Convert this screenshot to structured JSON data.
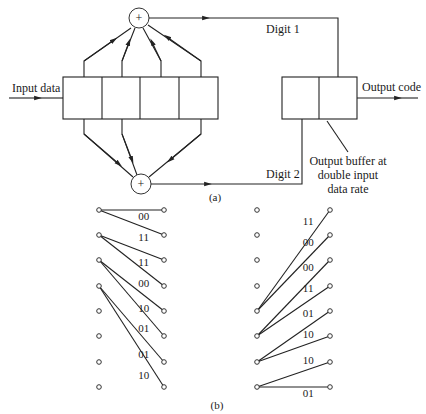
{
  "figure_a": {
    "caption": "(a)",
    "input_label": "Input data",
    "output_label": "Output code",
    "digit1_label": "Digit 1",
    "digit2_label": "Digit 2",
    "buffer_note": [
      "Output buffer at",
      "double input",
      "data rate"
    ],
    "adder_symbol": "+",
    "shift_register_cells": 4,
    "top_adder_taps": [
      1,
      2,
      3,
      4
    ],
    "bottom_adder_taps": [
      1,
      2,
      4
    ],
    "output_buffer_cells": 2
  },
  "figure_b": {
    "caption": "(b)",
    "states": 8,
    "left_trellis": {
      "branches": [
        {
          "from": 0,
          "to": 0,
          "label": "00"
        },
        {
          "from": 0,
          "to": 1,
          "label": "11"
        },
        {
          "from": 1,
          "to": 2,
          "label": "11"
        },
        {
          "from": 1,
          "to": 3,
          "label": "00"
        },
        {
          "from": 2,
          "to": 4,
          "label": "10"
        },
        {
          "from": 2,
          "to": 5,
          "label": "01"
        },
        {
          "from": 3,
          "to": 6,
          "label": "01"
        },
        {
          "from": 3,
          "to": 7,
          "label": "10"
        }
      ]
    },
    "right_trellis": {
      "branches": [
        {
          "from": 4,
          "to": 0,
          "label": "11"
        },
        {
          "from": 4,
          "to": 1,
          "label": "00"
        },
        {
          "from": 5,
          "to": 2,
          "label": "00"
        },
        {
          "from": 5,
          "to": 3,
          "label": "11"
        },
        {
          "from": 6,
          "to": 4,
          "label": "01"
        },
        {
          "from": 6,
          "to": 5,
          "label": "10"
        },
        {
          "from": 7,
          "to": 6,
          "label": "10"
        },
        {
          "from": 7,
          "to": 7,
          "label": "01"
        }
      ]
    }
  }
}
